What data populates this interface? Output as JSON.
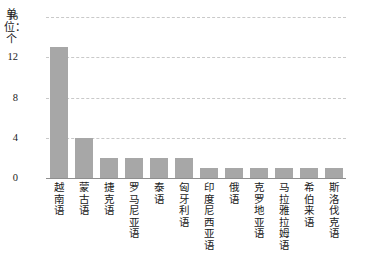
{
  "chart_data": {
    "type": "bar",
    "title": "",
    "xlabel": "",
    "ylabel": "单位：个",
    "ylim": [
      0,
      16
    ],
    "yticks": [
      0,
      4,
      8,
      12,
      16
    ],
    "grid": true,
    "legend": "none",
    "bar_color": "#a7a7a7",
    "categories": [
      "越南语",
      "蒙古语",
      "捷克语",
      "罗马尼亚语",
      "泰语",
      "匈牙利语",
      "印度尼西亚语",
      "俄语",
      "克罗地亚语",
      "马拉雅拉姆语",
      "希伯来语",
      "斯洛伐克语"
    ],
    "values": [
      13,
      4,
      2,
      2,
      2,
      2,
      1,
      1,
      1,
      1,
      1,
      1
    ]
  }
}
